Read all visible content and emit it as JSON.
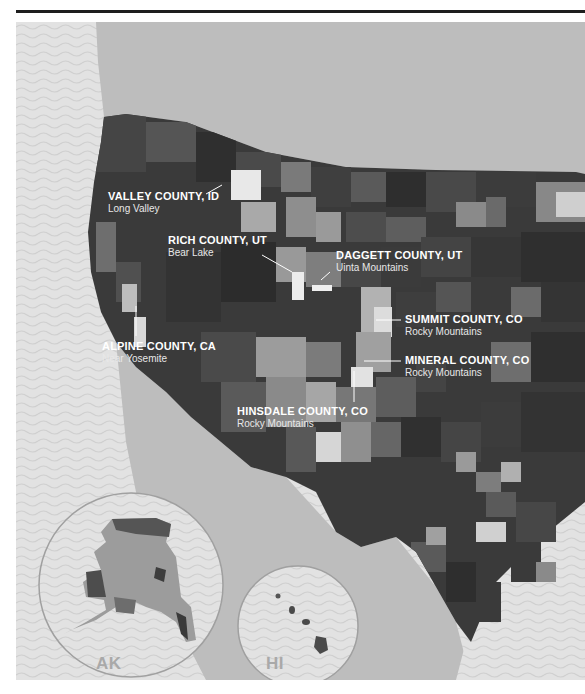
{
  "map": {
    "type": "choropleth",
    "palette": "grayscale",
    "colors": {
      "ocean_pattern": "#dcdcdc",
      "land_outside": "#bdbdbd",
      "county_dark": "#333333",
      "county_mid": "#6a6a6a",
      "county_light": "#a8a8a8",
      "county_highlight": "#e6e6e6",
      "label_text": "#ffffff",
      "inset_label": "#a9a9a9",
      "inset_circle_stroke": "#a0a0a0"
    },
    "annotations": [
      {
        "name": "VALLEY COUNTY, ID",
        "sub": "Long Valley"
      },
      {
        "name": "RICH COUNTY, UT",
        "sub": "Bear Lake"
      },
      {
        "name": "DAGGETT COUNTY, UT",
        "sub": "Uinta Mountains"
      },
      {
        "name": "SUMMIT COUNTY, CO",
        "sub": "Rocky Mountains"
      },
      {
        "name": "ALPINE COUNTY, CA",
        "sub": "Near Yosemite"
      },
      {
        "name": "MINERAL COUNTY, CO",
        "sub": "Rocky Mountains"
      },
      {
        "name": "HINSDALE COUNTY, CO",
        "sub": "Rocky Mountains"
      }
    ],
    "insets": [
      {
        "label": "AK"
      },
      {
        "label": "HI"
      }
    ]
  }
}
